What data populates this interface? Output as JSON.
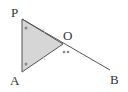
{
  "diagram": {
    "type": "geometry",
    "points": {
      "P": {
        "label": "P",
        "x": 22,
        "y": 19
      },
      "A": {
        "label": "A",
        "x": 22,
        "y": 72
      },
      "O": {
        "label": "O",
        "x": 63,
        "y": 44
      },
      "B": {
        "label": "B",
        "x": 110,
        "y": 70
      }
    },
    "shaded_triangle": [
      "P",
      "A",
      "O"
    ],
    "segments": [
      [
        "P",
        "A"
      ],
      [
        "P",
        "B"
      ],
      [
        "A",
        "O"
      ]
    ],
    "angle_marks": {
      "P": "single-dot",
      "A": "single-dot",
      "O": "double-dot"
    },
    "equal_side_ticks": [
      [
        "P",
        "O"
      ],
      [
        "A",
        "O"
      ]
    ],
    "colors": {
      "fill": "#d6d6d6",
      "line": "#555555",
      "mark": "#888888"
    }
  }
}
